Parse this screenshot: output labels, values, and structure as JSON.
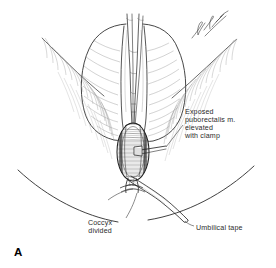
{
  "figure": {
    "panel_letter": "A",
    "type": "medical-surgical-illustration",
    "style": "black-and-white pen-and-ink line drawing",
    "background_color": "#ffffff",
    "ink_color": "#1a1a1a",
    "shading_color": "#8c8c8c",
    "artist_signature": "artist-signature-scribble"
  },
  "labels": [
    {
      "id": "puborectalis",
      "name": "exposed-puborectalis-label",
      "lines": [
        "Exposed",
        "puborectalis m.",
        "elevated",
        "with clamp"
      ],
      "position": "right-middle",
      "leader": "points left and down to the clamped muscle bundle"
    },
    {
      "id": "coccyx",
      "name": "coccyx-divided-label",
      "lines": [
        "Coccyx",
        "divided"
      ],
      "position": "bottom-left",
      "leader": "points up and right to the divided coccyx"
    },
    {
      "id": "umbilical_tape",
      "name": "umbilical-tape-label",
      "lines": [
        "Umbilical tape"
      ],
      "position": "bottom-right",
      "leader": "points up and left to the tape encircling the muscle"
    }
  ],
  "anatomy": [
    {
      "name": "left-buttock",
      "description": "left gluteal mass, upper left of midline"
    },
    {
      "name": "right-buttock",
      "description": "right gluteal mass, upper right of midline"
    },
    {
      "name": "gluteal-cleft",
      "description": "vertical midline cleft with radiating hatch shading"
    },
    {
      "name": "surgical-incision",
      "description": "vertical midline posterior incision"
    },
    {
      "name": "retractor-blades",
      "description": "paired narrow retractor blades holding the incision open"
    },
    {
      "name": "puborectalis-muscle",
      "description": "striated muscle bundle elevated in the wound"
    },
    {
      "name": "clamp",
      "description": "clamp grasping and elevating the puborectalis muscle"
    },
    {
      "name": "umbilical-tape",
      "description": "tape passed beneath the muscle, trailing to lower right"
    },
    {
      "name": "divided-coccyx",
      "description": "cut end of the coccyx below the muscle"
    },
    {
      "name": "lower-body-contour",
      "description": "broad sweeping curve of the upper thighs and perineum"
    }
  ]
}
